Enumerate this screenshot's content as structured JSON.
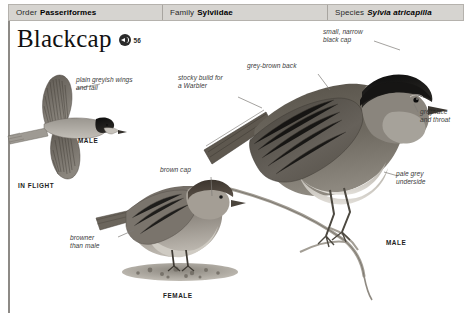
{
  "header": {
    "order": {
      "label": "Order",
      "value": "Passeriformes"
    },
    "family": {
      "label": "Family",
      "value": "Sylviidae"
    },
    "species": {
      "label": "Species",
      "value": "Sylvia atricapilla"
    }
  },
  "title": {
    "name": "Blackcap",
    "audio_icon": "speaker-icon",
    "audio_track": "56"
  },
  "annotations": {
    "plain_wings": "plain greyish wings\nand tail",
    "stocky_build": "stocky build for\na Warbler",
    "grey_brown_back": "grey-brown back",
    "small_narrow_cap": "small, narrow\nblack cap",
    "grey_face": "grey face\nand throat",
    "pale_underside": "pale grey\nunderside",
    "brown_cap": "brown cap",
    "browner_than_male": "browner\nthan male"
  },
  "captions": {
    "flight_male": "MALE",
    "in_flight": "IN FLIGHT",
    "perched_male": "MALE",
    "female": "FEMALE"
  },
  "colors": {
    "header_fill": "#d6d4d0",
    "header_border": "#b5b2ad",
    "rule": "#8d8a86",
    "text": "#1b1b1b",
    "annotation": "#3b3b3b",
    "cap_black": "#1a1a1a",
    "back_grey_brown": "#6f6a62",
    "underside_pale": "#c9c6bf",
    "branch": "#9a958d"
  }
}
